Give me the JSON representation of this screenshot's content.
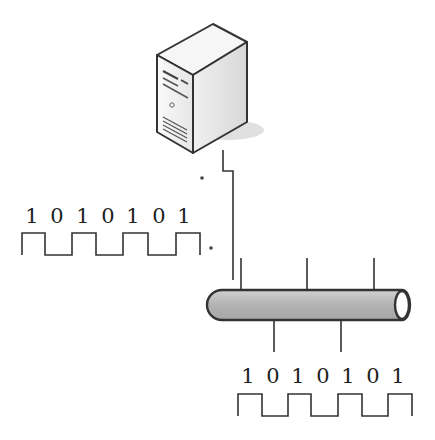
{
  "diagram": {
    "type": "bus-network-signal",
    "server": {
      "label": "",
      "icon": "server-tower-icon"
    },
    "bus": {
      "label": "",
      "icon": "cable-bus-icon"
    },
    "signal_left": {
      "bits": [
        "1",
        "0",
        "1",
        "0",
        "1",
        "0",
        "1"
      ]
    },
    "signal_right": {
      "bits": [
        "1",
        "0",
        "1",
        "0",
        "1",
        "0",
        "1"
      ]
    },
    "colors": {
      "line": "#333333",
      "bus_fill": "#b5b5b5",
      "server_fill": "#ececec",
      "text": "#222222"
    }
  }
}
